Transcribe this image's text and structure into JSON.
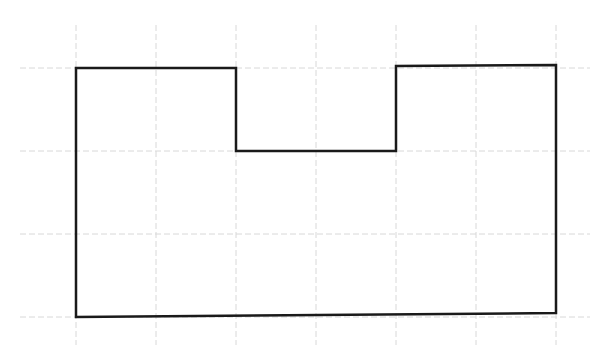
{
  "diagram": {
    "type": "grid-polygon",
    "background": "#ffffff",
    "grid": {
      "color": "#d8d8d8",
      "vertical_x": [
        76,
        156,
        236,
        316,
        396,
        476,
        556
      ],
      "vertical_y_range": [
        25,
        345
      ],
      "horizontal_y": [
        68,
        151,
        234,
        317
      ],
      "horizontal_x_range": [
        20,
        590
      ]
    },
    "shape": {
      "stroke": "#1a1a1a",
      "stroke_width": 2.5,
      "points": [
        [
          76,
          68
        ],
        [
          236,
          68
        ],
        [
          236,
          151
        ],
        [
          396,
          151
        ],
        [
          396,
          66
        ],
        [
          556,
          65
        ],
        [
          556,
          313
        ],
        [
          76,
          317
        ]
      ]
    }
  }
}
